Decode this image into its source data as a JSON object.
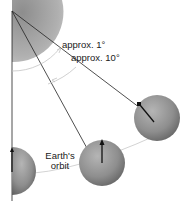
{
  "diagram": {
    "labels": {
      "angle_small": "approx. 1°",
      "angle_large": "approx. 10°",
      "orbit_line1": "Earth's",
      "orbit_line2": "orbit"
    },
    "colors": {
      "sun_fill": "#a8a8a8",
      "planet_fill": "#9a9a9a",
      "line": "#222222",
      "arc": "#bdbdbd",
      "orbit": "#c8c8c8"
    },
    "elements": [
      {
        "id": "sun-quarter",
        "shape": "quarter-disc",
        "position": "top-left"
      },
      {
        "id": "earth-1",
        "position": "left-bottom",
        "partial": true
      },
      {
        "id": "earth-2",
        "position": "center-bottom"
      },
      {
        "id": "earth-3",
        "position": "right"
      }
    ]
  }
}
